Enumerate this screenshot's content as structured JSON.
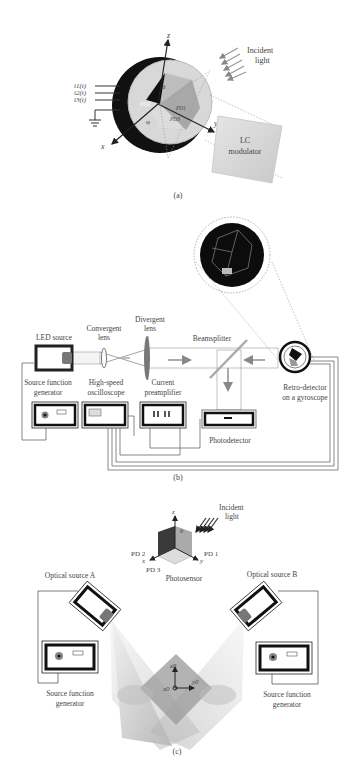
{
  "panel_a": {
    "caption": "(a)",
    "axis_z": "z",
    "axis_x": "x",
    "axis_y": "y",
    "theta": "θ",
    "phi": "φ",
    "currents": [
      "i1(t)",
      "i2(t)",
      "i3(t)"
    ],
    "photodiodes": [
      "PD1",
      "PD2",
      "PD3"
    ],
    "incident_light": [
      "Incident",
      "light"
    ],
    "lc_modulator": [
      "LC",
      "modulator"
    ]
  },
  "panel_b": {
    "caption": "(b)",
    "led_source": "LED source",
    "convergent_lens": [
      "Convergent",
      "lens"
    ],
    "divergent_lens": [
      "Divergent",
      "lens"
    ],
    "beamsplitter": "Beamsplitter",
    "source_function_generator": [
      "Source function",
      "generator"
    ],
    "oscilloscope": [
      "High-speed",
      "oscilloscope"
    ],
    "preamplifier": [
      "Current",
      "preamplifier"
    ],
    "retro_detector": [
      "Retro-detector",
      "on a gyroscope"
    ],
    "photodetector": "Photodetector"
  },
  "panel_c": {
    "caption": "(c)",
    "incident_light": [
      "Incident",
      "light"
    ],
    "axis_z": "z",
    "axis_x": "x",
    "axis_y": "y",
    "theta": "θ",
    "pd1": "PD 1",
    "pd2": "PD 2",
    "pd3": "PD 3",
    "photosensor": "Photosensor",
    "source_a": "Optical source A",
    "source_b": "Optical source B",
    "generator_left": [
      "Source function",
      "generator"
    ],
    "generator_right": [
      "Source function",
      "generator"
    ],
    "origin_z": "z0",
    "origin_y": "y0",
    "origin_x": "x0"
  }
}
